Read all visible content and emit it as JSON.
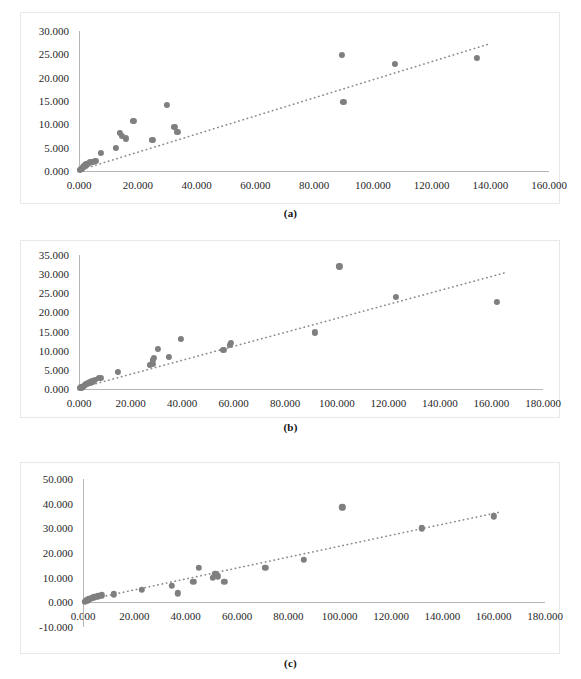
{
  "figure": {
    "captions": {
      "a": "(a)",
      "b": "(b)",
      "c": "(c)"
    },
    "marker_color": "#7f7f7f",
    "trendline_color": "#8a8a8a",
    "axis_color": "#b6b6b6",
    "panel_border_color": "#e8e8e8",
    "background": "#ffffff"
  },
  "chart_data": [
    {
      "type": "scatter",
      "panel": "a",
      "title": "",
      "xlabel": "",
      "ylabel": "",
      "xlim": [
        0,
        160
      ],
      "ylim": [
        0,
        30
      ],
      "xticks": [
        0,
        20,
        40,
        60,
        80,
        100,
        120,
        140,
        160
      ],
      "yticks": [
        0,
        5,
        10,
        15,
        20,
        25,
        30
      ],
      "xticklabels": [
        "0.000",
        "20.000",
        "40.000",
        "60.000",
        "80.000",
        "100.000",
        "120.000",
        "140.000",
        "160.000"
      ],
      "yticklabels": [
        "0.000",
        "5.000",
        "10.000",
        "15.000",
        "20.000",
        "25.000",
        "30.000"
      ],
      "grid": false,
      "legend": "none",
      "points": [
        [
          0.4,
          0.2
        ],
        [
          0.7,
          0.4
        ],
        [
          1.0,
          0.5
        ],
        [
          1.3,
          0.8
        ],
        [
          1.6,
          1.0
        ],
        [
          2.0,
          1.2
        ],
        [
          2.4,
          1.4
        ],
        [
          2.9,
          1.6
        ],
        [
          3.3,
          1.8
        ],
        [
          3.9,
          1.9
        ],
        [
          4.6,
          2.0
        ],
        [
          5.6,
          2.1
        ],
        [
          7.5,
          3.9
        ],
        [
          12.5,
          4.9
        ],
        [
          14.0,
          8.2
        ],
        [
          14.6,
          7.5
        ],
        [
          16.0,
          7.0
        ],
        [
          18.5,
          10.7
        ],
        [
          25.0,
          6.7
        ],
        [
          30.0,
          14.1
        ],
        [
          32.5,
          9.4
        ],
        [
          33.5,
          8.3
        ],
        [
          89.5,
          24.9
        ],
        [
          90.0,
          14.8
        ],
        [
          107.5,
          23.0
        ],
        [
          135.5,
          24.3
        ]
      ],
      "trendline": {
        "x0": 0,
        "y0": 0.15,
        "x1": 140.0,
        "y1": 27.3,
        "style": "dotted"
      }
    },
    {
      "type": "scatter",
      "panel": "b",
      "title": "",
      "xlabel": "",
      "ylabel": "",
      "xlim": [
        0,
        180
      ],
      "ylim": [
        0,
        35
      ],
      "xticks": [
        0,
        20,
        40,
        60,
        80,
        100,
        120,
        140,
        160,
        180
      ],
      "yticks": [
        0,
        5,
        10,
        15,
        20,
        25,
        30,
        35
      ],
      "xticklabels": [
        "0.000",
        "20.000",
        "40.000",
        "60.000",
        "80.000",
        "100.000",
        "120.000",
        "140.000",
        "160.000",
        "180.000"
      ],
      "yticklabels": [
        "0.000",
        "5.000",
        "10.000",
        "15.000",
        "20.000",
        "25.000",
        "30.000",
        "35.000"
      ],
      "grid": false,
      "legend": "none",
      "points": [
        [
          0.5,
          0.2
        ],
        [
          0.9,
          0.4
        ],
        [
          1.3,
          0.6
        ],
        [
          1.8,
          0.9
        ],
        [
          2.3,
          1.1
        ],
        [
          2.9,
          1.3
        ],
        [
          3.6,
          1.5
        ],
        [
          4.3,
          1.7
        ],
        [
          5.2,
          2.0
        ],
        [
          6.3,
          2.4
        ],
        [
          7.6,
          2.9
        ],
        [
          8.4,
          3.0
        ],
        [
          15.0,
          4.5
        ],
        [
          27.5,
          6.3
        ],
        [
          28.5,
          6.6
        ],
        [
          28.8,
          7.7
        ],
        [
          29.2,
          8.1
        ],
        [
          30.5,
          10.5
        ],
        [
          35.0,
          8.3
        ],
        [
          39.5,
          13.0
        ],
        [
          56.0,
          10.2
        ],
        [
          58.5,
          11.5
        ],
        [
          58.8,
          12.0
        ],
        [
          91.5,
          14.8
        ],
        [
          101.0,
          32.0
        ],
        [
          123.0,
          24.0
        ],
        [
          162.0,
          22.8
        ]
      ],
      "trendline": {
        "x0": 0,
        "y0": 0.2,
        "x1": 166.0,
        "y1": 30.5,
        "style": "dotted"
      }
    },
    {
      "type": "scatter",
      "panel": "c",
      "title": "",
      "xlabel": "",
      "ylabel": "",
      "xlim": [
        0,
        180
      ],
      "ylim": [
        -10,
        50
      ],
      "xticks": [
        0,
        20,
        40,
        60,
        80,
        100,
        120,
        140,
        160,
        180
      ],
      "yticks": [
        -10,
        0,
        10,
        20,
        30,
        40,
        50
      ],
      "xticklabels": [
        "0.000",
        "20.000",
        "40.000",
        "60.000",
        "80.000",
        "100.000",
        "120.000",
        "140.000",
        "160.000",
        "180.000"
      ],
      "yticklabels": [
        "-10.000",
        "0.000",
        "10.000",
        "20.000",
        "30.000",
        "40.000",
        "50.000"
      ],
      "grid": false,
      "legend": "none",
      "points": [
        [
          0.6,
          0.3
        ],
        [
          1.1,
          0.6
        ],
        [
          1.7,
          0.9
        ],
        [
          2.3,
          1.2
        ],
        [
          3.0,
          1.5
        ],
        [
          3.6,
          1.8
        ],
        [
          4.3,
          2.0
        ],
        [
          5.0,
          2.2
        ],
        [
          5.8,
          2.4
        ],
        [
          6.6,
          2.6
        ],
        [
          7.4,
          2.8
        ],
        [
          12.0,
          3.2
        ],
        [
          23.0,
          5.0
        ],
        [
          34.5,
          6.6
        ],
        [
          37.0,
          3.7
        ],
        [
          43.0,
          8.2
        ],
        [
          45.0,
          14.0
        ],
        [
          50.5,
          9.9
        ],
        [
          51.5,
          11.3
        ],
        [
          52.5,
          10.6
        ],
        [
          55.0,
          8.3
        ],
        [
          71.0,
          13.9
        ],
        [
          86.0,
          17.2
        ],
        [
          101.0,
          38.5
        ],
        [
          132.0,
          30.0
        ],
        [
          160.0,
          34.8
        ]
      ],
      "trendline": {
        "x0": 4.0,
        "y0": 1.5,
        "x1": 162.0,
        "y1": 36.5,
        "style": "dotted"
      }
    }
  ]
}
